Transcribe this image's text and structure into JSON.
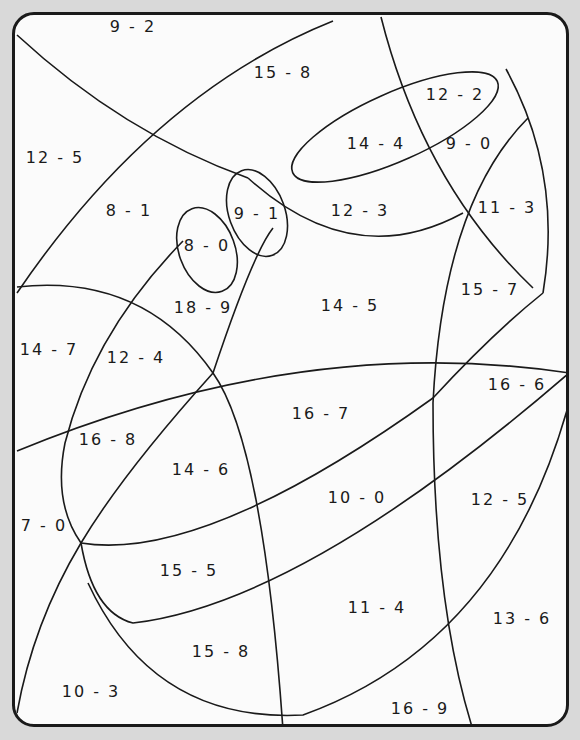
{
  "worksheet": {
    "type": "color-by-number subtraction",
    "regions": [
      {
        "label": "9 - 2"
      },
      {
        "label": "13 - 6"
      },
      {
        "label": "15 - 8"
      },
      {
        "label": "12 - 2"
      },
      {
        "label": "12 - 5"
      },
      {
        "label": "14 - 4"
      },
      {
        "label": "9 - 0"
      },
      {
        "label": "8 - 1"
      },
      {
        "label": "9 - 1"
      },
      {
        "label": "12 - 3"
      },
      {
        "label": "11 - 3"
      },
      {
        "label": "8 - 0"
      },
      {
        "label": "15 - 7"
      },
      {
        "label": "18 - 9"
      },
      {
        "label": "14 - 5"
      },
      {
        "label": "14 - 7"
      },
      {
        "label": "12 - 4"
      },
      {
        "label": "16 - 6"
      },
      {
        "label": "16 - 7"
      },
      {
        "label": "16 - 8"
      },
      {
        "label": "14 - 6"
      },
      {
        "label": "10 - 0"
      },
      {
        "label": "12 - 5"
      },
      {
        "label": "7 - 0"
      },
      {
        "label": "15 - 5"
      },
      {
        "label": "11 - 4"
      },
      {
        "label": "13 - 6"
      },
      {
        "label": "15 - 8"
      },
      {
        "label": "10 - 3"
      },
      {
        "label": "16 - 9"
      }
    ]
  }
}
